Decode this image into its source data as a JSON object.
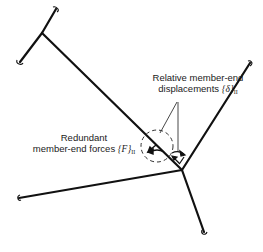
{
  "diagram": {
    "type": "rigid frame joint with redundant member-end forces",
    "colors": {
      "member": "#111111",
      "annotation": "#333333",
      "background": "#ffffff"
    },
    "labels": {
      "displacements": {
        "line1": "Relative member-end",
        "line2": "displacements",
        "symbol": "{δ}",
        "subscript": "II"
      },
      "forces": {
        "line1": "Redundant",
        "line2": "member-end forces",
        "symbol": "{F}",
        "subscript": "II"
      }
    },
    "joints": [
      {
        "id": "upper-left-joint",
        "x": 42,
        "y": 33
      },
      {
        "id": "central-joint",
        "x": 182,
        "y": 170
      }
    ],
    "members": [
      {
        "id": "upper-left-branch-a",
        "from": [
          42,
          33
        ],
        "to": [
          56,
          9
        ]
      },
      {
        "id": "upper-left-branch-b",
        "from": [
          42,
          33
        ],
        "to": [
          20,
          62
        ]
      },
      {
        "id": "diagonal-member",
        "from": [
          42,
          33
        ],
        "to": [
          182,
          170
        ]
      },
      {
        "id": "upper-right-member",
        "from": [
          182,
          170
        ],
        "to": [
          250,
          63
        ]
      },
      {
        "id": "left-member",
        "from": [
          182,
          170
        ],
        "to": [
          19,
          198
        ]
      },
      {
        "id": "lower-member",
        "from": [
          182,
          170
        ],
        "to": [
          204,
          232
        ]
      }
    ],
    "cut_circle": {
      "cx": 157,
      "cy": 146,
      "r": 16,
      "style": "dashed"
    }
  }
}
